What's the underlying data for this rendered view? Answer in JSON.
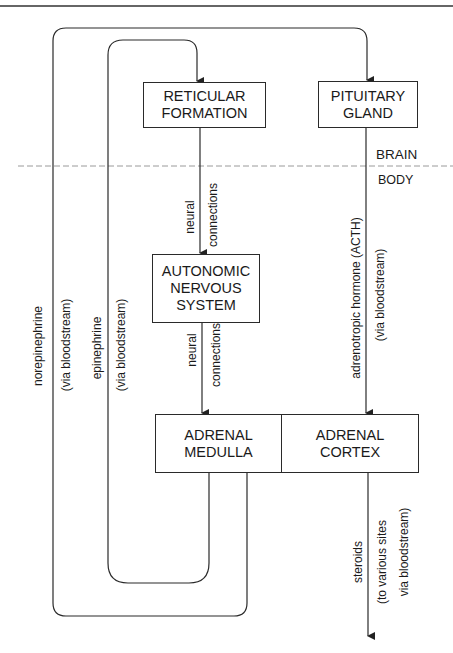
{
  "nodes": {
    "reticular": "RETICULAR\nFORMATION",
    "pituitary": "PITUITARY\nGLAND",
    "ans": "AUTONOMIC\nNERVOUS\nSYSTEM",
    "medulla": "ADRENAL\nMEDULLA",
    "cortex": "ADRENAL\nCORTEX"
  },
  "regions": {
    "brain": "BRAIN",
    "body": "BODY"
  },
  "edge_labels": {
    "rf_ans_1": "neural",
    "rf_ans_2": "connections",
    "ans_med_1": "neural",
    "ans_med_2": "connections",
    "pit_cortex_1": "adrenotropic hormone (ACTH)",
    "pit_cortex_2": "(via bloodstream)",
    "norepi_1": "norepinephrine",
    "norepi_2": "(via bloodstream)",
    "epi_1": "epinephrine",
    "epi_2": "(via bloodstream)",
    "steroids_1": "steroids",
    "steroids_2": "(to various sites",
    "steroids_3": "via bloodstream)"
  },
  "colors": {
    "line": "#2a2a2a",
    "dashed": "#9a9a9a"
  }
}
